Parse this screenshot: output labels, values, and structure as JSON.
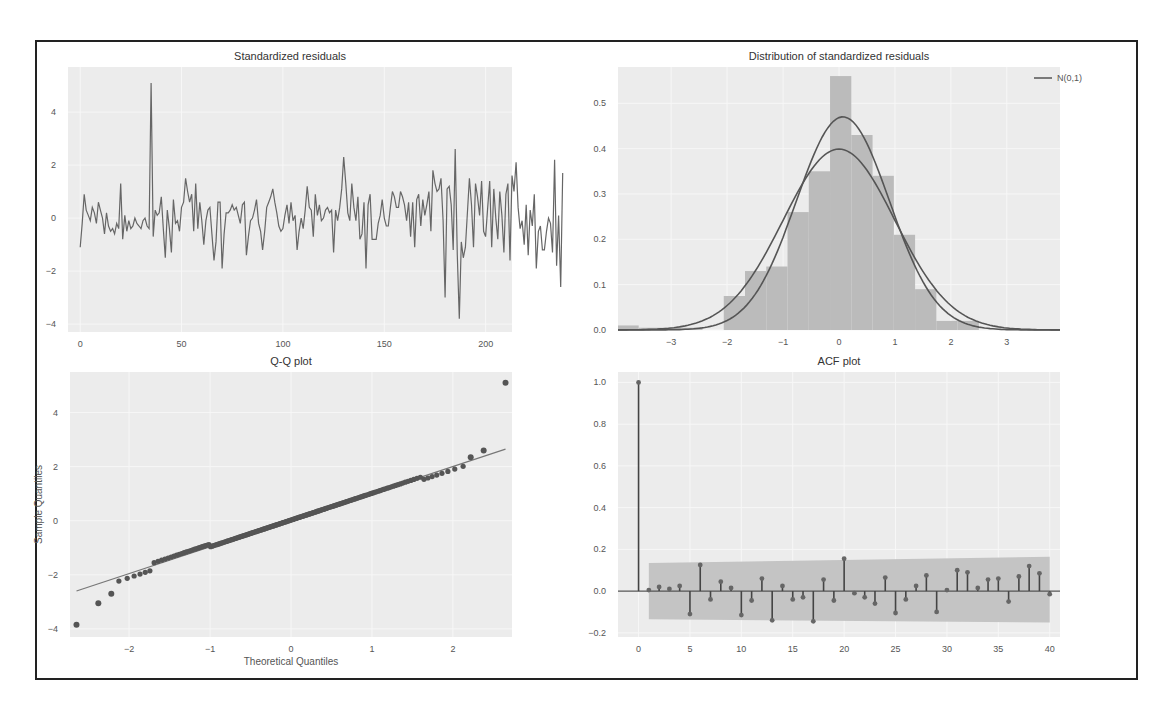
{
  "chart_data": [
    {
      "type": "line",
      "title": "Standardized residuals",
      "xlabel": "",
      "ylabel": "",
      "xlim": [
        -6,
        213
      ],
      "ylim": [
        -4.3,
        5.7
      ],
      "xticks": [
        0,
        50,
        100,
        150,
        200
      ],
      "yticks": [
        -4,
        -2,
        0,
        2,
        4
      ],
      "grid": true,
      "series": [
        {
          "name": "residuals",
          "color": "#666666",
          "y": [
            -1.1,
            -0.2,
            0.9,
            0.3,
            0.1,
            -0.1,
            0.4,
            0.2,
            -0.2,
            0.6,
            0.3,
            0.0,
            -0.6,
            0.2,
            -0.3,
            -0.5,
            -0.4,
            -0.6,
            -0.2,
            -0.4,
            1.3,
            -0.8,
            0.1,
            -0.5,
            -0.1,
            -0.4,
            -0.3,
            0.0,
            -0.2,
            -0.3,
            -0.4,
            -0.1,
            0.0,
            -0.3,
            -0.4,
            5.1,
            -0.7,
            0.3,
            0.1,
            0.2,
            0.8,
            -0.4,
            -1.5,
            0.3,
            -0.4,
            -1.3,
            0.7,
            -0.2,
            -0.1,
            -0.5,
            0.4,
            0.6,
            1.5,
            1.0,
            0.6,
            0.9,
            -0.5,
            1.3,
            -0.4,
            0.6,
            -0.1,
            -1.0,
            -0.1,
            0.3,
            0.4,
            -0.6,
            -1.6,
            -0.9,
            0.6,
            0.6,
            -1.9,
            -0.6,
            0.2,
            0.2,
            0.3,
            0.5,
            0.3,
            0.4,
            0.1,
            -0.2,
            0.5,
            0.6,
            -1.4,
            -0.7,
            -0.1,
            0.0,
            0.3,
            0.7,
            -0.2,
            -0.5,
            -1.2,
            -0.5,
            0.4,
            0.6,
            0.8,
            1.1,
            0.6,
            0.2,
            -0.3,
            -0.5,
            -0.4,
            0.1,
            0.5,
            -0.2,
            0.6,
            -0.1,
            0.1,
            -1.2,
            -0.5,
            0.0,
            -0.4,
            0.3,
            1.2,
            0.4,
            0.3,
            -0.7,
            0.9,
            0.1,
            0.5,
            -0.1,
            0.0,
            0.3,
            0.4,
            0.2,
            0.3,
            -1.3,
            0.3,
            -0.1,
            0.4,
            1.1,
            2.3,
            1.3,
            0.2,
            -0.1,
            1.3,
            0.4,
            -0.1,
            0.8,
            -0.8,
            -0.6,
            0.6,
            -1.9,
            0.5,
            0.9,
            -0.8,
            -0.8,
            -0.8,
            -0.2,
            0.1,
            0.7,
            0.0,
            -0.3,
            -0.3,
            0.4,
            1.0,
            0.8,
            0.4,
            0.4,
            1.0,
            0.8,
            0.5,
            -0.1,
            0.6,
            -0.7,
            0.6,
            -1.1,
            0.7,
            0.9,
            -0.3,
            0.7,
            0.1,
            0.5,
            1.0,
            -0.5,
            1.8,
            1.3,
            1.0,
            1.1,
            1.5,
            -0.1,
            -3.0,
            1.1,
            1.2,
            0.5,
            -1.2,
            2.6,
            -1.4,
            -3.8,
            -0.9,
            -1.5,
            -1.1,
            0.2,
            1.5,
            0.5,
            -1.1,
            1.3,
            0.8,
            0.1,
            1.4,
            -0.5,
            -0.7,
            0.4,
            1.4,
            -1.1,
            1.1,
            0.0,
            -0.8,
            1.0,
            0.1,
            -1.3,
            0.9,
            1.3,
            -1.6,
            1.6,
            1.0,
            2.1,
            0.4,
            -0.4,
            -0.1,
            -1.0,
            0.5,
            -1.4,
            0.3,
            -0.3,
            0.9,
            -1.9,
            -0.5,
            -0.3,
            -1.2,
            -1.2,
            -0.5,
            0.0,
            -0.2,
            -1.3,
            2.2,
            -1.8,
            0.1,
            -2.6,
            1.7
          ]
        }
      ]
    },
    {
      "type": "bar",
      "title": "Distribution of standardized residuals",
      "xlabel": "",
      "ylabel": "",
      "xlim": [
        -3.95,
        3.95
      ],
      "ylim": [
        0.0,
        0.58
      ],
      "xticks": [
        -3,
        -2,
        -1,
        0,
        1,
        2,
        3
      ],
      "yticks": [
        0.0,
        0.1,
        0.2,
        0.3,
        0.4,
        0.5
      ],
      "grid": true,
      "legend": {
        "position": "top-right",
        "entries": [
          "N(0,1)"
        ]
      },
      "histogram": {
        "bin_edges": [
          -3.95,
          -3.58,
          -3.2,
          -2.82,
          -2.44,
          -2.06,
          -1.68,
          -1.3,
          -0.92,
          -0.54,
          -0.16,
          0.22,
          0.6,
          0.98,
          1.36,
          1.74,
          2.12,
          2.5,
          2.88,
          3.26,
          3.64,
          3.95
        ],
        "heights": [
          0.01,
          0.005,
          0.005,
          0.005,
          0.0,
          0.075,
          0.13,
          0.14,
          0.26,
          0.35,
          0.56,
          0.43,
          0.34,
          0.21,
          0.09,
          0.02,
          0.02,
          0.0,
          0.0,
          0.0,
          0.0
        ],
        "color": "#bbbbbb"
      },
      "series": [
        {
          "name": "KDE",
          "color": "#555555",
          "peak": 0.47,
          "mean": 0.07,
          "std": 0.83
        },
        {
          "name": "N(0,1)",
          "color": "#555555",
          "peak": 0.399,
          "mean": 0.0,
          "std": 1.0
        }
      ]
    },
    {
      "type": "scatter",
      "title": "Q-Q plot",
      "xlabel": "Theoretical Quantiles",
      "ylabel": "Sample Quantiles",
      "xlim": [
        -2.73,
        2.73
      ],
      "ylim": [
        -4.3,
        5.5
      ],
      "xticks": [
        -2,
        -1,
        0,
        1,
        2
      ],
      "yticks": [
        -4,
        -2,
        0,
        2,
        4
      ],
      "grid": true,
      "n_points": 209,
      "reference_line": {
        "x": [
          -2.65,
          2.65
        ],
        "y": [
          -2.6,
          2.65
        ]
      },
      "outliers": [
        {
          "x": -2.65,
          "y": -3.85
        },
        {
          "x": -2.38,
          "y": -3.05
        },
        {
          "x": -2.22,
          "y": -2.7
        },
        {
          "x": 2.22,
          "y": 2.35
        },
        {
          "x": 2.38,
          "y": 2.6
        },
        {
          "x": 2.65,
          "y": 5.1
        }
      ],
      "color": "#555555"
    },
    {
      "type": "bar",
      "title": "ACF plot",
      "xlabel": "",
      "ylabel": "",
      "xlim": [
        -2,
        41
      ],
      "ylim": [
        -0.22,
        1.05
      ],
      "xticks": [
        0,
        5,
        10,
        15,
        20,
        25,
        30,
        35,
        40
      ],
      "yticks": [
        -0.2,
        0.0,
        0.2,
        0.4,
        0.6,
        0.8,
        1.0
      ],
      "grid": true,
      "confidence_band": {
        "start_lag": 1,
        "end_lag": 40,
        "upper_start": 0.135,
        "upper_end": 0.165,
        "lower_start": -0.135,
        "lower_end": -0.15
      },
      "lags": [
        0,
        1,
        2,
        3,
        4,
        5,
        6,
        7,
        8,
        9,
        10,
        11,
        12,
        13,
        14,
        15,
        16,
        17,
        18,
        19,
        20,
        21,
        22,
        23,
        24,
        25,
        26,
        27,
        28,
        29,
        30,
        31,
        32,
        33,
        34,
        35,
        36,
        37,
        38,
        39,
        40
      ],
      "values": [
        1.0,
        0.005,
        0.02,
        0.01,
        0.025,
        -0.11,
        0.125,
        -0.04,
        0.045,
        0.015,
        -0.115,
        -0.045,
        0.06,
        -0.14,
        0.025,
        -0.04,
        -0.03,
        -0.145,
        0.055,
        -0.045,
        0.155,
        -0.01,
        -0.03,
        -0.06,
        0.065,
        -0.105,
        -0.04,
        0.025,
        0.075,
        -0.1,
        0.005,
        0.1,
        0.09,
        0.015,
        0.055,
        0.06,
        -0.05,
        0.07,
        0.12,
        0.085,
        -0.015
      ],
      "color": "#444444"
    }
  ]
}
